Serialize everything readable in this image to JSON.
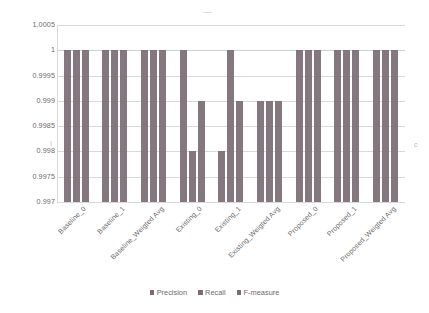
{
  "chart_data": {
    "type": "bar",
    "title": "",
    "subtitle": "",
    "xlabel": "",
    "ylabel": "",
    "ylim": [
      0.997,
      1.0005
    ],
    "ytick_step": 0.0005,
    "ytick_labels": [
      "1.0005",
      "1",
      "0.9995",
      "0.999",
      "0.9985",
      "0.998",
      "0.9975",
      "0.997"
    ],
    "ytick_values": [
      1.0005,
      1.0,
      0.9995,
      0.999,
      0.9985,
      0.998,
      0.9975,
      0.997
    ],
    "grid": true,
    "legend_position": "bottom",
    "categories": [
      "Baseline_0",
      "Baseline_1",
      "Baseline_Weigted Avg",
      "Existing_0",
      "Existing_1",
      "Existing_Weigted Avg",
      "Proposed_0",
      "Proposed_1",
      "Proposed_Weigted Avg"
    ],
    "series": [
      {
        "name": "Precision",
        "color": "#7b6b73",
        "values": [
          1,
          1,
          1,
          1,
          0.998,
          0.999,
          1,
          1,
          1
        ]
      },
      {
        "name": "Recall",
        "color": "#7b6b73",
        "values": [
          1,
          1,
          1,
          0.998,
          1,
          0.999,
          1,
          1,
          1
        ]
      },
      {
        "name": "F-measure",
        "color": "#7b6b73",
        "values": [
          1,
          1,
          1,
          0.999,
          0.999,
          0.999,
          1,
          1,
          1
        ]
      }
    ]
  },
  "legend": {
    "items": [
      {
        "label": "Precision"
      },
      {
        "label": "Recall"
      },
      {
        "label": "F-measure"
      }
    ]
  },
  "artifacts": {
    "left_tick_mark": "I",
    "right_edge_mark": "c"
  },
  "colors": {
    "bar": "#7b6b73",
    "gridline": "#d9d9d9",
    "text": "#6b6b6b",
    "background": "#ffffff"
  }
}
